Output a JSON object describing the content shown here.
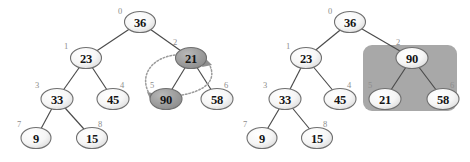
{
  "figure": {
    "background_color": "#ffffff",
    "edge_color": "#4a4a4a",
    "node_stroke_color": "#6f6f6f",
    "node_fill_plain": "#f2f2f2",
    "node_fill_highlight": "#9b9b9b",
    "index_color": "#8d8d8d",
    "value_color": "#141414",
    "group_box_color": "#a8a8a8",
    "arrow_color": "#9b9b9b"
  },
  "panels": [
    {
      "name": "before-swap",
      "caption": "",
      "nodes": [
        {
          "index": "0",
          "value": "36",
          "x": 140,
          "y": 22,
          "highlight": false
        },
        {
          "index": "1",
          "value": "23",
          "x": 86,
          "y": 58,
          "highlight": false
        },
        {
          "index": "2",
          "value": "21",
          "x": 191,
          "y": 58,
          "highlight": true
        },
        {
          "index": "3",
          "value": "33",
          "x": 57,
          "y": 99,
          "highlight": false
        },
        {
          "index": "4",
          "value": "45",
          "x": 113,
          "y": 99,
          "highlight": false
        },
        {
          "index": "5",
          "value": "90",
          "x": 166,
          "y": 99,
          "highlight": true
        },
        {
          "index": "6",
          "value": "58",
          "x": 217,
          "y": 99,
          "highlight": false
        },
        {
          "index": "7",
          "value": "9",
          "x": 36,
          "y": 138,
          "highlight": false
        },
        {
          "index": "8",
          "value": "15",
          "x": 92,
          "y": 138,
          "highlight": false
        }
      ],
      "edges": [
        {
          "from": "0",
          "to": "1"
        },
        {
          "from": "0",
          "to": "2"
        },
        {
          "from": "1",
          "to": "3"
        },
        {
          "from": "1",
          "to": "4"
        },
        {
          "from": "2",
          "to": "5"
        },
        {
          "from": "2",
          "to": "6"
        },
        {
          "from": "3",
          "to": "7"
        },
        {
          "from": "3",
          "to": "8"
        }
      ],
      "swap_arrows": [
        {
          "name": "arrow-21-to-90",
          "from": "2",
          "to": "5"
        },
        {
          "name": "arrow-90-to-21",
          "from": "5",
          "to": "2"
        }
      ],
      "group_box": null
    },
    {
      "name": "after-swap",
      "caption": "",
      "nodes": [
        {
          "index": "0",
          "value": "36",
          "x": 350,
          "y": 22,
          "highlight": false
        },
        {
          "index": "1",
          "value": "23",
          "x": 306,
          "y": 58,
          "highlight": false
        },
        {
          "index": "2",
          "value": "90",
          "x": 412,
          "y": 58,
          "highlight": false
        },
        {
          "index": "3",
          "value": "33",
          "x": 285,
          "y": 99,
          "highlight": false
        },
        {
          "index": "4",
          "value": "45",
          "x": 340,
          "y": 99,
          "highlight": false
        },
        {
          "index": "5",
          "value": "21",
          "x": 385,
          "y": 99,
          "highlight": false
        },
        {
          "index": "6",
          "value": "58",
          "x": 443,
          "y": 99,
          "highlight": false
        },
        {
          "index": "7",
          "value": "9",
          "x": 262,
          "y": 138,
          "highlight": false
        },
        {
          "index": "8",
          "value": "15",
          "x": 317,
          "y": 138,
          "highlight": false
        }
      ],
      "edges": [
        {
          "from": "0",
          "to": "1"
        },
        {
          "from": "0",
          "to": "2"
        },
        {
          "from": "1",
          "to": "3"
        },
        {
          "from": "1",
          "to": "4"
        },
        {
          "from": "2",
          "to": "5"
        },
        {
          "from": "2",
          "to": "6"
        },
        {
          "from": "3",
          "to": "7"
        },
        {
          "from": "3",
          "to": "8"
        }
      ],
      "swap_arrows": [],
      "group_box": {
        "x": 363,
        "y": 45,
        "width": 94,
        "height": 66,
        "radius": 9
      }
    }
  ]
}
